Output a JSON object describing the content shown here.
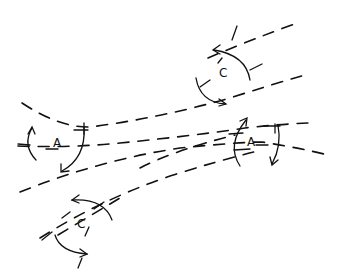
{
  "diagram": {
    "type": "hand-drawn flow diagram",
    "stroke_color": "#111111",
    "background_color": "#ffffff",
    "flow_lines": [
      {
        "id": "line-1",
        "path": "M208 58 Q250 40 300 22"
      },
      {
        "id": "line-2",
        "path": "M22 103 Q60 128 90 127 Q160 118 230 98 Q270 85 305 75"
      },
      {
        "id": "line-3",
        "path": "M18 146 Q70 148 120 143 Q200 135 245 128 Q280 124 310 123"
      },
      {
        "id": "line-4",
        "path": "M20 192 Q100 160 180 148 Q240 142 262 142 Q300 148 328 155"
      },
      {
        "id": "line-5",
        "path": "M40 238 Q100 200 170 176 Q220 160 262 150"
      },
      {
        "id": "line-6",
        "path": "M140 168 Q175 150 235 135"
      },
      {
        "id": "line-7",
        "path": "M58 235 Q100 210 120 198"
      }
    ],
    "circulations": [
      {
        "id": "anticyclone-left",
        "label": "A",
        "label_x": 53,
        "label_y": 137
      },
      {
        "id": "anticyclone-right",
        "label": "A",
        "label_x": 247,
        "label_y": 136
      },
      {
        "id": "cyclone-top",
        "label": "C",
        "label_x": 219,
        "label_y": 67
      },
      {
        "id": "cyclone-bottom",
        "label": "C",
        "label_x": 77,
        "label_y": 218
      }
    ]
  }
}
